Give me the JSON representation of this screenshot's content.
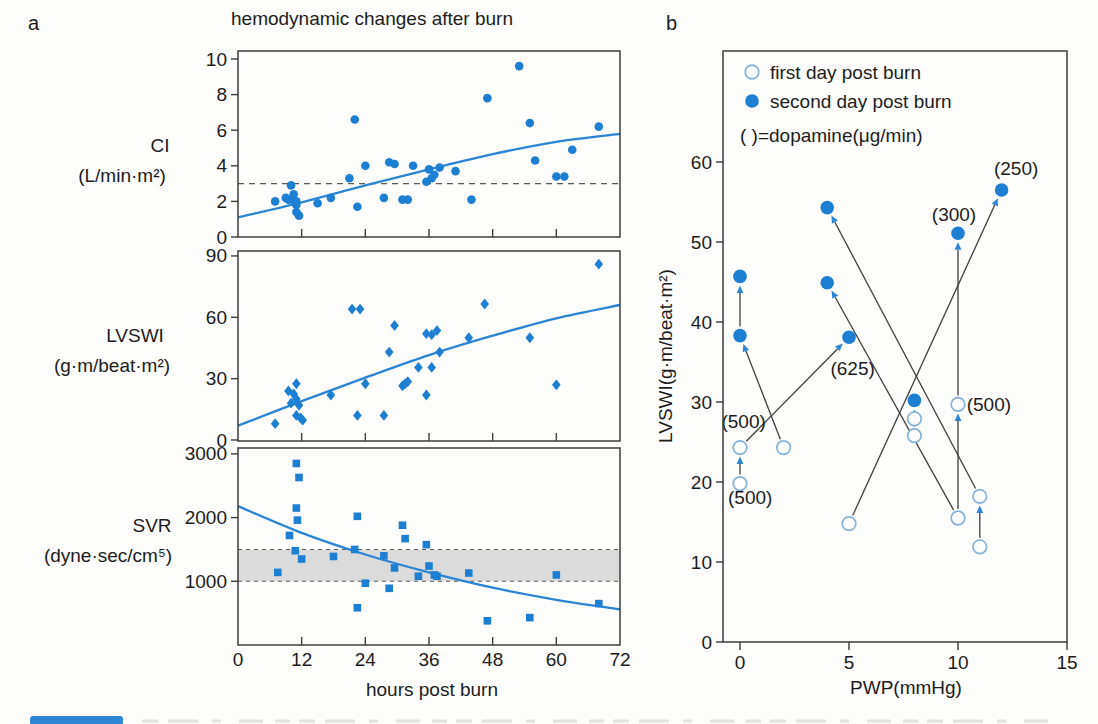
{
  "colors": {
    "accent": "#1d7fd2",
    "open_marker_stroke": "#84b3dc",
    "curve": "#2b85d5",
    "arrow_head": "#2f86d2",
    "connector_line": "#3f3f3f",
    "frame": "#3d3d3d",
    "dashed_line": "#5a5a5a",
    "normal_band_fill": "#d9d9d9",
    "text": "#1c1c1c",
    "caption_bar": "#2e86d5",
    "background": "#fdfdfb"
  },
  "chart_data": [
    {
      "panel": "a",
      "tag": "a",
      "type": "scatter",
      "title": "hemodynamic changes after burn",
      "xlabel": "hours post burn",
      "xlim": [
        0,
        72
      ],
      "x_ticks": [
        0,
        12,
        24,
        36,
        48,
        60,
        72
      ],
      "subplots": [
        {
          "name": "CI",
          "unit": "(L/min·m²)",
          "marker": "circle",
          "ylim": [
            0,
            10.4
          ],
          "y_ticks": [
            0,
            2,
            4,
            6,
            8,
            10
          ],
          "reference_line": 3,
          "points": [
            [
              7,
              2.0
            ],
            [
              9,
              2.2
            ],
            [
              9.5,
              2.1
            ],
            [
              10,
              2.9
            ],
            [
              10.3,
              2.1
            ],
            [
              10.5,
              2.4
            ],
            [
              11,
              2.0
            ],
            [
              11,
              1.8
            ],
            [
              11,
              1.4
            ],
            [
              11.5,
              1.2
            ],
            [
              15,
              1.9
            ],
            [
              17.5,
              2.2
            ],
            [
              21,
              3.3
            ],
            [
              22,
              6.6
            ],
            [
              22.5,
              1.7
            ],
            [
              24,
              4.0
            ],
            [
              27.5,
              2.2
            ],
            [
              28.5,
              4.2
            ],
            [
              29.5,
              4.1
            ],
            [
              31,
              2.1
            ],
            [
              32,
              2.1
            ],
            [
              33,
              4.0
            ],
            [
              35.5,
              3.1
            ],
            [
              36,
              3.8
            ],
            [
              36.5,
              3.3
            ],
            [
              37,
              3.5
            ],
            [
              38,
              3.9
            ],
            [
              41,
              3.7
            ],
            [
              44,
              2.1
            ],
            [
              47,
              7.8
            ],
            [
              53,
              9.6
            ],
            [
              55,
              6.4
            ],
            [
              56,
              4.3
            ],
            [
              60,
              3.4
            ],
            [
              61.5,
              3.4
            ],
            [
              63,
              4.9
            ],
            [
              68,
              6.2
            ]
          ],
          "fit_curve": [
            [
              0,
              1.1
            ],
            [
              12,
              1.95
            ],
            [
              24,
              2.9
            ],
            [
              36,
              3.8
            ],
            [
              48,
              4.65
            ],
            [
              60,
              5.35
            ],
            [
              72,
              5.8
            ]
          ]
        },
        {
          "name": "LVSWI",
          "unit": "(g·m/beat·m²)",
          "marker": "diamond",
          "ylim": [
            0,
            93
          ],
          "y_ticks": [
            0,
            30,
            60,
            90
          ],
          "points": [
            [
              7,
              8
            ],
            [
              9.5,
              24
            ],
            [
              10,
              18
            ],
            [
              10.5,
              22.5
            ],
            [
              11,
              27.5
            ],
            [
              11,
              20
            ],
            [
              11.5,
              17
            ],
            [
              11,
              12
            ],
            [
              11.8,
              10.8
            ],
            [
              12.2,
              9.7
            ],
            [
              17.5,
              22
            ],
            [
              21.5,
              64
            ],
            [
              23,
              64
            ],
            [
              22.5,
              12
            ],
            [
              24,
              27.5
            ],
            [
              27.5,
              12
            ],
            [
              28.5,
              43
            ],
            [
              29.5,
              56
            ],
            [
              31,
              26.5
            ],
            [
              31.5,
              27.5
            ],
            [
              32,
              28.5
            ],
            [
              34,
              35.5
            ],
            [
              35.5,
              52
            ],
            [
              36.5,
              51.5
            ],
            [
              37.5,
              53.5
            ],
            [
              35.5,
              22
            ],
            [
              36.5,
              35.5
            ],
            [
              38,
              43
            ],
            [
              43.5,
              50
            ],
            [
              46.5,
              66.5
            ],
            [
              55,
              50
            ],
            [
              60,
              27
            ],
            [
              68,
              86
            ]
          ],
          "fit_curve": [
            [
              0,
              7
            ],
            [
              12,
              19
            ],
            [
              24,
              30.5
            ],
            [
              36,
              41.5
            ],
            [
              48,
              51
            ],
            [
              60,
              59.5
            ],
            [
              72,
              66
            ]
          ]
        },
        {
          "name": "SVR",
          "unit": "(dyne·sec/cm⁵)",
          "marker": "square",
          "ylim": [
            0,
            3090
          ],
          "y_ticks": [
            1000,
            2000,
            3000
          ],
          "normal_band": [
            1000,
            1500
          ],
          "points": [
            [
              7.5,
              1140
            ],
            [
              9.7,
              1720
            ],
            [
              11,
              2850
            ],
            [
              11,
              2150
            ],
            [
              11.2,
              1960
            ],
            [
              11.5,
              2630
            ],
            [
              10.8,
              1480
            ],
            [
              12,
              1350
            ],
            [
              18,
              1390
            ],
            [
              22,
              1500
            ],
            [
              22.5,
              2020
            ],
            [
              22.5,
              585
            ],
            [
              24,
              970
            ],
            [
              27.5,
              1400
            ],
            [
              28.5,
              890
            ],
            [
              29.5,
              1210
            ],
            [
              31,
              1880
            ],
            [
              31.5,
              1670
            ],
            [
              34,
              1080
            ],
            [
              35.5,
              1575
            ],
            [
              36,
              1240
            ],
            [
              37,
              1100
            ],
            [
              37.5,
              1080
            ],
            [
              43.5,
              1130
            ],
            [
              47,
              380
            ],
            [
              55,
              430
            ],
            [
              60,
              1100
            ],
            [
              68,
              650
            ]
          ],
          "fit_curve": [
            [
              0,
              2180
            ],
            [
              12,
              1760
            ],
            [
              24,
              1420
            ],
            [
              36,
              1140
            ],
            [
              48,
              900
            ],
            [
              60,
              710
            ],
            [
              72,
              560
            ]
          ]
        }
      ]
    },
    {
      "panel": "b",
      "tag": "b",
      "type": "paired-scatter",
      "xlabel": "PWP(mmHg)",
      "ylabel": "LVSWI(g·m/beat·m²)",
      "xlim": [
        -0.8,
        15
      ],
      "ylim": [
        0,
        74
      ],
      "x_ticks": [
        0,
        5,
        10,
        15
      ],
      "y_ticks": [
        0,
        10,
        20,
        30,
        40,
        50,
        60
      ],
      "legend": [
        {
          "marker": "open-circle",
          "label": "first day post burn"
        },
        {
          "marker": "filled-circle",
          "label": "second day post burn"
        }
      ],
      "legend_note": "(  )=dopamine(μg/min)",
      "first_day_points": [
        [
          0,
          24.3
        ],
        [
          0,
          19.8
        ],
        [
          2,
          24.3
        ],
        [
          5,
          14.8
        ],
        [
          8,
          27.9
        ],
        [
          8,
          25.8
        ],
        [
          10,
          29.7
        ],
        [
          10,
          15.5
        ],
        [
          11,
          18.2
        ],
        [
          11,
          11.9
        ]
      ],
      "second_day_points": [
        [
          0,
          45.7
        ],
        [
          0,
          38.3
        ],
        [
          4,
          54.3
        ],
        [
          4,
          44.9
        ],
        [
          5,
          38.1
        ],
        [
          8,
          30.2
        ],
        [
          10,
          51.1
        ],
        [
          12,
          56.5
        ]
      ],
      "arrows": [
        {
          "from": [
            0,
            19.8
          ],
          "to": [
            0,
            24.3
          ]
        },
        {
          "from": [
            0,
            38.3
          ],
          "to": [
            0,
            45.7
          ]
        },
        {
          "from": [
            2,
            24.3
          ],
          "to": [
            0,
            38.3
          ]
        },
        {
          "from": [
            0,
            24.3
          ],
          "to": [
            5,
            38.1
          ]
        },
        {
          "from": [
            5,
            14.8
          ],
          "to": [
            12,
            56.5
          ]
        },
        {
          "from": [
            11,
            18.2
          ],
          "to": [
            4,
            54.3
          ]
        },
        {
          "from": [
            10,
            15.5
          ],
          "to": [
            4,
            44.9
          ]
        },
        {
          "from": [
            10,
            15.5
          ],
          "to": [
            10,
            29.7
          ]
        },
        {
          "from": [
            10,
            29.7
          ],
          "to": [
            10,
            51.1
          ]
        },
        {
          "from": [
            8,
            25.8
          ],
          "to": [
            8,
            30.2
          ]
        },
        {
          "from": [
            11,
            11.9
          ],
          "to": [
            11,
            18.2
          ]
        }
      ],
      "dose_labels": [
        {
          "text": "(500)",
          "x": -0.85,
          "y": 26.8
        },
        {
          "text": "(500)",
          "x": -0.55,
          "y": 17.2
        },
        {
          "text": "(625)",
          "x": 4.15,
          "y": 33.4
        },
        {
          "text": "(300)",
          "x": 8.8,
          "y": 52.6
        },
        {
          "text": "(250)",
          "x": 11.65,
          "y": 58.4
        },
        {
          "text": "(500)",
          "x": 10.4,
          "y": 28.9
        }
      ]
    }
  ],
  "caption_bar": {
    "visible": true,
    "color": "#2e86d5"
  }
}
